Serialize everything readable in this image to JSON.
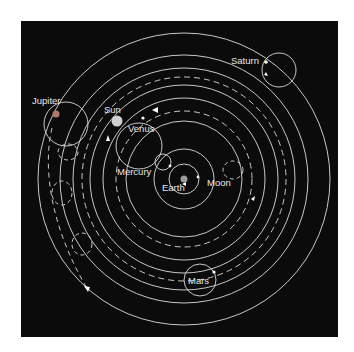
{
  "diagram": {
    "background": "#0b0b0b",
    "line_color": "#dcdcdc",
    "center": {
      "x": 184,
      "y": 179
    },
    "labels": {
      "earth": "Earth",
      "moon": "Moon",
      "mercury": "Mercury",
      "venus": "Venus",
      "sun": "Sun",
      "mars": "Mars",
      "jupiter": "Jupiter",
      "saturn": "Saturn"
    },
    "deferents": [
      {
        "body": "Moon",
        "radius": 15
      },
      {
        "body": "Mercury",
        "radius": 30
      },
      {
        "body": "Venus",
        "radius": 58
      },
      {
        "body": "Sun",
        "radius": 78
      },
      {
        "body": "Mars",
        "radius": 94
      },
      {
        "body": "Jupiter",
        "radius": 111
      },
      {
        "body": "Saturn",
        "radius": 124
      },
      {
        "body": "Outer",
        "radius": 146
      }
    ],
    "colors": {
      "sun": "#cfcfcf",
      "jupiter": "#b07a6a",
      "earth": "#9a9a9a",
      "planet_dot": "#ffffff"
    }
  }
}
